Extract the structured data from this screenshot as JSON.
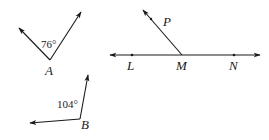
{
  "diagram": {
    "angle_a": {
      "vertex_label": "A",
      "measure": "76°"
    },
    "angle_b": {
      "vertex_label": "B",
      "measure": "104°"
    },
    "line_figure": {
      "points": [
        "L",
        "M",
        "N"
      ],
      "ray_label": "P",
      "labels": {
        "L": "L",
        "M": "M",
        "N": "N",
        "P": "P"
      }
    },
    "colors": {
      "stroke": "#1a1a1a",
      "background": "#ffffff"
    }
  }
}
